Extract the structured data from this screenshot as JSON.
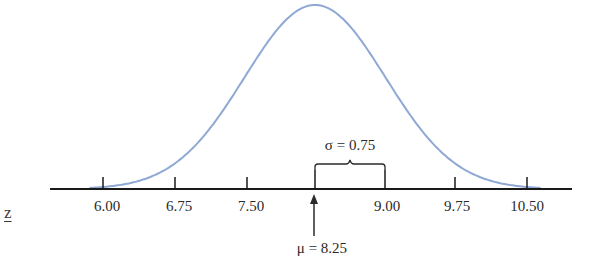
{
  "chart_data": {
    "type": "line",
    "title": "",
    "xlabel": "",
    "ylabel": "",
    "mean": 8.25,
    "sd": 0.75,
    "x_ticks": [
      6.0,
      6.75,
      7.5,
      8.25,
      9.0,
      9.75,
      10.5
    ],
    "x_tick_labels": [
      "6.00",
      "6.75",
      "7.50",
      "",
      "9.00",
      "9.75",
      "10.50"
    ],
    "annotations": [
      {
        "text": "σ = 0.75",
        "type": "brace",
        "from": 8.25,
        "to": 9.0
      },
      {
        "text": "μ = 8.25",
        "type": "arrow",
        "at": 8.25
      }
    ],
    "curve_color": "#8fa8d4",
    "axis_color": "#1a1a1a",
    "grid": false,
    "legend": null
  },
  "labels": {
    "z": "z",
    "t0": "6.00",
    "t1": "6.75",
    "t2": "7.50",
    "t4": "9.00",
    "t5": "9.75",
    "t6": "10.50",
    "sigma": "σ = 0.75",
    "mu": "μ = 8.25"
  }
}
